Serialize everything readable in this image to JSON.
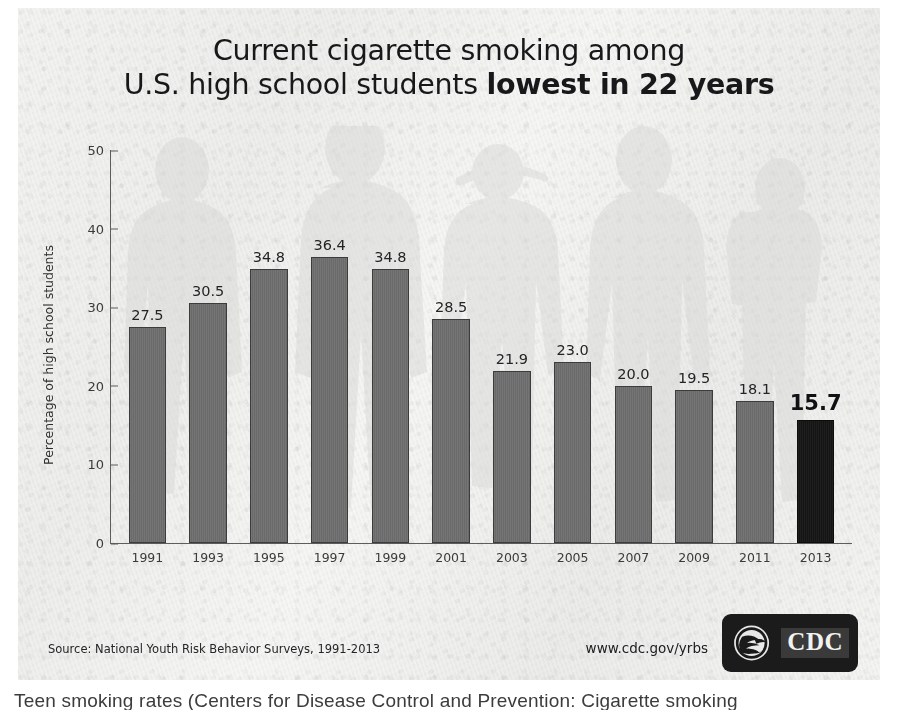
{
  "poster": {
    "title_line_1": "Current cigarette smoking among",
    "title_line_2_normal": "U.S. high school students ",
    "title_line_2_bold": "lowest in 22 years",
    "source_note": "Source: National Youth Risk Behavior Surveys, 1991-2013",
    "url": "www.cdc.gov/yrbs",
    "logo_text": "CDC",
    "colors": {
      "bar": "#6f6e6e",
      "bar_outline": "#3c3c3c",
      "bar_highlight": "#161616",
      "axis": "#5d5d5d",
      "paper": "#f2f2f0",
      "text": "#18181a"
    }
  },
  "caption": {
    "text": "Teen smoking rates (Centers for Disease Control and Prevention: Cigarette smoking"
  },
  "chart_data": {
    "type": "bar",
    "title": "Current cigarette smoking among U.S. high school students lowest in 22 years",
    "xlabel": "",
    "ylabel": "Percentage of high school students",
    "categories": [
      "1991",
      "1993",
      "1995",
      "1997",
      "1999",
      "2001",
      "2003",
      "2005",
      "2007",
      "2009",
      "2011",
      "2013"
    ],
    "values": [
      27.5,
      30.5,
      34.8,
      36.4,
      34.8,
      28.5,
      21.9,
      23.0,
      20.0,
      19.5,
      18.1,
      15.7
    ],
    "value_labels": [
      "27.5",
      "30.5",
      "34.8",
      "36.4",
      "34.8",
      "28.5",
      "21.9",
      "23.0",
      "20.0",
      "19.5",
      "18.1",
      "15.7"
    ],
    "highlight_index": 11,
    "ylim": [
      0,
      50
    ],
    "yticks": [
      0,
      10,
      20,
      30,
      40,
      50
    ],
    "ytick_labels": [
      "0",
      "10",
      "20",
      "30",
      "40",
      "50"
    ],
    "grid": false,
    "legend": false,
    "source": "National Youth Risk Behavior Surveys, 1991-2013"
  }
}
